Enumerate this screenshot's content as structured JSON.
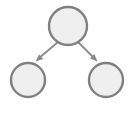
{
  "diagram": {
    "canvas": {
      "width": 135,
      "height": 114,
      "background": "#ffffff"
    },
    "style": {
      "node_fill": "#efefef",
      "node_stroke": "#808080",
      "node_stroke_width": 2.4,
      "edge_color": "#8a8a8a",
      "edge_width": 1.8
    },
    "nodes": [
      {
        "id": "root",
        "label": "",
        "cx": 68,
        "cy": 26,
        "r": 19
      },
      {
        "id": "child-left",
        "label": "",
        "cx": 28,
        "cy": 80,
        "r": 17
      },
      {
        "id": "child-right",
        "label": "",
        "cx": 106,
        "cy": 80,
        "r": 17
      }
    ],
    "edges": [
      {
        "id": "root-to-left",
        "from": "root",
        "to": "child-left",
        "direction": "down-left",
        "arrowhead": true,
        "x1": 58,
        "y1": 42,
        "x2": 38.5,
        "y2": 58.5,
        "tip_x": 35.5,
        "tip_y": 61.5
      },
      {
        "id": "root-to-right",
        "from": "root",
        "to": "child-right",
        "direction": "down-right",
        "arrowhead": true,
        "x1": 78,
        "y1": 42,
        "x2": 94.5,
        "y2": 58.5,
        "tip_x": 97.5,
        "tip_y": 61.5
      }
    ]
  }
}
